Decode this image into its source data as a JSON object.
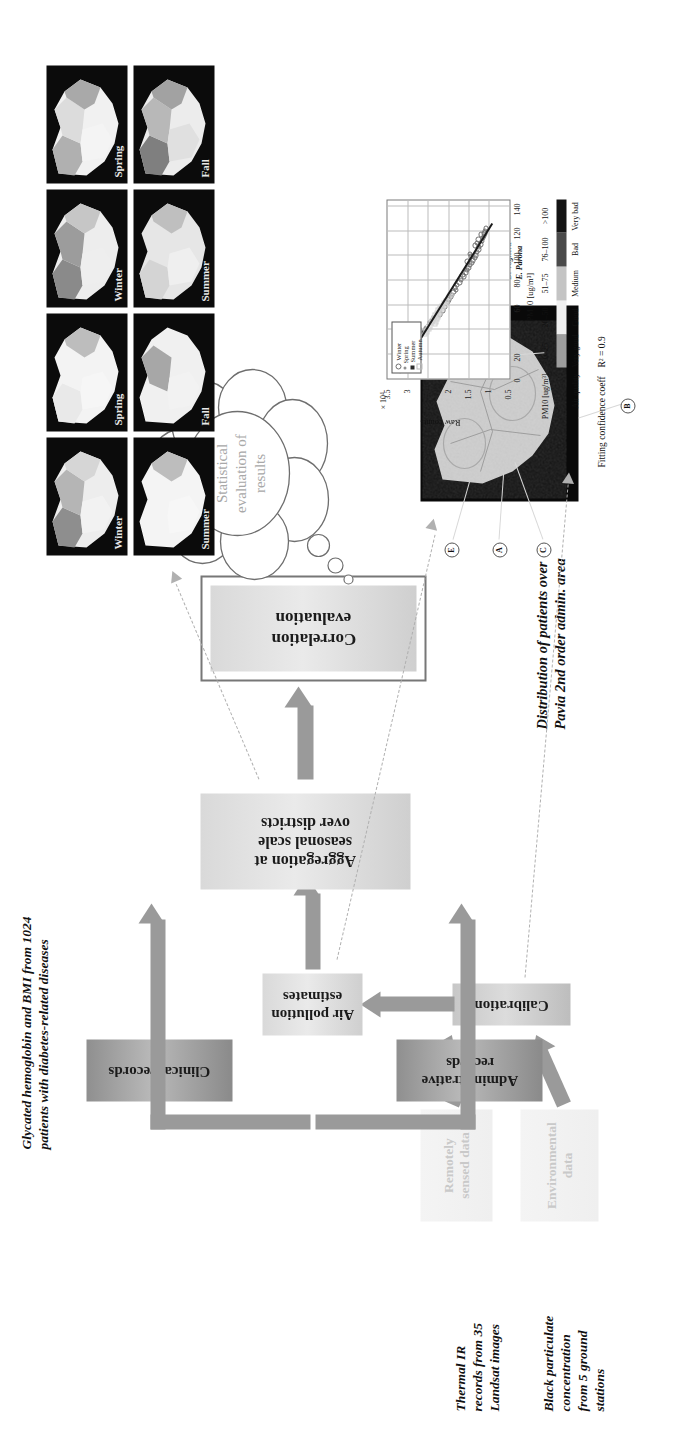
{
  "flow": {
    "boxes": [
      {
        "id": "remotely-sensed-data",
        "label": "Remotely\nsensed data",
        "style": "ghost"
      },
      {
        "id": "environmental-data",
        "label": "Environmental\ndata",
        "style": "ghost"
      },
      {
        "id": "calibration",
        "label": "Calibration",
        "style": "g-mid"
      },
      {
        "id": "air-pollution-estimates",
        "label": "Air pollution\nestimates",
        "style": "g-light"
      },
      {
        "id": "clinical-records",
        "label": "Clinical records",
        "style": "g-dark"
      },
      {
        "id": "administrative-records",
        "label": "Administrative\nrecords",
        "style": "g-dark"
      },
      {
        "id": "aggregation",
        "label": "Aggregation at\nseasonal scale\nover districts",
        "style": "g-light"
      },
      {
        "id": "correlation-evaluation",
        "label": "Correlation\nevaluation",
        "style": "g-light"
      }
    ]
  },
  "cloud": {
    "text": "Statistical\nevaluation of\nresults"
  },
  "captions": {
    "thermal_ir": "Thermal IR\nrecords from 35\nLandsat images",
    "black_particulate": "Black particulate\nconcentration\nfrom 5 ground\nstations",
    "clinical": "Glycated hemoglobin and BMI from 1024\npatients with diabetes-related diseases",
    "distribution": "Distribution of patients over\nPavia 2nd order admin. area"
  },
  "season_maps": {
    "panels": [
      {
        "label": "Winter"
      },
      {
        "label": "Spring"
      },
      {
        "label": "Winter"
      },
      {
        "label": "Spring"
      },
      {
        "label": "Summer"
      },
      {
        "label": "Fall"
      },
      {
        "label": "Summer"
      },
      {
        "label": "Fall"
      }
    ]
  },
  "satellite_map": {
    "header": "Ground stations for\nblack particulate\nevaluation",
    "stations": [
      {
        "key": "A",
        "name": "A. Vigevano"
      },
      {
        "key": "B",
        "name": "B. Sannazzaro De'B."
      },
      {
        "key": "C",
        "name": "C. Pavia"
      },
      {
        "key": "D",
        "name": "D. Voghera"
      },
      {
        "key": "E",
        "name": "E. Parona"
      }
    ],
    "markers": [
      "A",
      "B",
      "C",
      "D",
      "E"
    ]
  },
  "colorbar": {
    "row1_label": "PM10 [ug/m³]",
    "row2_label": "Air quality",
    "ranges": [
      "0–25",
      "26–50",
      "51–75",
      "76–100",
      ">100"
    ],
    "quality": [
      "Very good",
      "Good",
      "Medium",
      "Bad",
      "Very bad"
    ],
    "colors": [
      "#9e9e9e",
      "#f0f0f0",
      "#c4c4c4",
      "#4a4a4a",
      "#141414"
    ]
  },
  "fit": {
    "title": "Fitting confidence coeff",
    "r2": "R² = 0.9"
  },
  "chart_data": {
    "type": "scatter",
    "title": "Fitting confidence coeff",
    "xlabel": "PM10 [ug/m³]",
    "ylabel": "Raw counts",
    "y_exponent": "× 10⁴",
    "xlim": [
      0,
      145
    ],
    "ylim": [
      0.5,
      3.5
    ],
    "xticks": [
      0,
      20,
      40,
      60,
      80,
      100,
      120,
      140
    ],
    "yticks": [
      0.5,
      1,
      1.5,
      2,
      2.5,
      3,
      3.5
    ],
    "grid": true,
    "legend_position": "top-left",
    "legend": [
      "Winter",
      "Spring",
      "Summer",
      "Autumn"
    ],
    "fit_line": {
      "x": [
        5,
        127
      ],
      "y": [
        3.22,
        0.93
      ],
      "r2": 0.9
    },
    "series": [
      {
        "name": "Winter",
        "marker": "circle-open",
        "color": "#6f6f6f",
        "points": [
          [
            62,
            2.02
          ],
          [
            66,
            1.95
          ],
          [
            70,
            1.88
          ],
          [
            74,
            1.85
          ],
          [
            78,
            1.74
          ],
          [
            80,
            1.7
          ],
          [
            83,
            1.62
          ],
          [
            86,
            1.58
          ],
          [
            88,
            1.55
          ],
          [
            90,
            1.52
          ],
          [
            92,
            1.48
          ],
          [
            94,
            1.44
          ],
          [
            96,
            1.4
          ],
          [
            98,
            1.36
          ],
          [
            100,
            1.33
          ],
          [
            101,
            1.48
          ],
          [
            103,
            1.3
          ],
          [
            105,
            1.27
          ],
          [
            107,
            1.25
          ],
          [
            109,
            1.22
          ],
          [
            112,
            1.18
          ],
          [
            114,
            1.16
          ],
          [
            116,
            1.13
          ],
          [
            118,
            1.12
          ],
          [
            120,
            1.11
          ],
          [
            122,
            1.08
          ],
          [
            58,
            2.1
          ],
          [
            55,
            2.15
          ],
          [
            52,
            2.22
          ],
          [
            76,
            1.8
          ],
          [
            84,
            1.66
          ],
          [
            95,
            1.54
          ],
          [
            99,
            1.45
          ],
          [
            108,
            1.35
          ],
          [
            110,
            1.31
          ],
          [
            113,
            1.27
          ],
          [
            117,
            1.21
          ],
          [
            64,
            1.99
          ],
          [
            68,
            1.92
          ],
          [
            72,
            1.83
          ]
        ]
      },
      {
        "name": "Spring",
        "marker": "dot",
        "color": "#909090",
        "points": [
          [
            20,
            3.05
          ],
          [
            22,
            3.0
          ],
          [
            24,
            2.96
          ],
          [
            26,
            2.92
          ],
          [
            28,
            2.88
          ],
          [
            30,
            2.84
          ],
          [
            32,
            2.8
          ],
          [
            34,
            2.76
          ],
          [
            36,
            2.71
          ],
          [
            38,
            2.66
          ],
          [
            40,
            2.6
          ],
          [
            42,
            2.56
          ],
          [
            44,
            2.52
          ],
          [
            46,
            2.48
          ],
          [
            48,
            2.44
          ],
          [
            50,
            2.4
          ],
          [
            25,
            2.94
          ],
          [
            29,
            2.86
          ],
          [
            33,
            2.78
          ],
          [
            37,
            2.69
          ],
          [
            41,
            2.58
          ]
        ]
      },
      {
        "name": "Summer",
        "marker": "star",
        "color": "#2b2b2b",
        "points": [
          [
            14,
            3.18
          ],
          [
            16,
            3.14
          ],
          [
            17,
            3.12
          ],
          [
            18,
            3.1
          ],
          [
            19,
            3.08
          ],
          [
            20,
            3.07
          ],
          [
            21,
            3.06
          ],
          [
            22,
            3.03
          ],
          [
            23,
            3.01
          ],
          [
            24,
            2.99
          ],
          [
            25,
            2.97
          ],
          [
            26,
            2.95
          ],
          [
            15,
            3.16
          ],
          [
            13,
            3.2
          ],
          [
            18,
            3.02
          ],
          [
            21,
            2.99
          ],
          [
            24,
            2.93
          ],
          [
            27,
            2.9
          ],
          [
            30,
            2.85
          ],
          [
            34,
            2.73
          ],
          [
            38,
            2.62
          ],
          [
            28,
            3.04
          ],
          [
            31,
            2.96
          ],
          [
            12,
            3.22
          ],
          [
            19,
            3.0
          ],
          [
            22,
            2.96
          ],
          [
            16,
            3.08
          ],
          [
            23,
            3.05
          ],
          [
            35,
            2.8
          ],
          [
            40,
            2.7
          ]
        ]
      },
      {
        "name": "Autumn",
        "marker": "square-open",
        "color": "#cfcfcf",
        "points": [
          [
            44,
            2.35
          ],
          [
            46,
            2.32
          ],
          [
            48,
            2.3
          ],
          [
            50,
            2.27
          ],
          [
            52,
            2.25
          ],
          [
            54,
            2.22
          ],
          [
            56,
            2.18
          ],
          [
            58,
            2.14
          ],
          [
            60,
            2.1
          ],
          [
            62,
            2.06
          ],
          [
            45,
            2.44
          ],
          [
            47,
            2.4
          ],
          [
            49,
            2.36
          ],
          [
            51,
            2.33
          ],
          [
            53,
            2.29
          ],
          [
            55,
            2.26
          ],
          [
            57,
            2.21
          ],
          [
            59,
            2.16
          ],
          [
            61,
            2.12
          ],
          [
            63,
            2.08
          ],
          [
            40,
            2.5
          ],
          [
            42,
            2.46
          ],
          [
            66,
            2.0
          ],
          [
            68,
            1.96
          ],
          [
            38,
            2.55
          ],
          [
            36,
            2.58
          ]
        ]
      }
    ]
  }
}
